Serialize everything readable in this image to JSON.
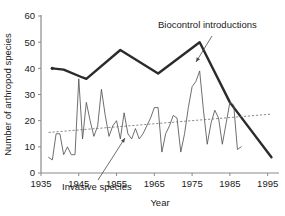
{
  "chart_data": {
    "type": "line",
    "title": "",
    "xlabel": "Year",
    "ylabel": "Number of arthropod species",
    "xlim": [
      1935,
      1998
    ],
    "ylim": [
      0,
      60
    ],
    "xticks": [
      1935,
      1945,
      1955,
      1965,
      1975,
      1985,
      1995
    ],
    "yticks": [
      0,
      10,
      20,
      30,
      40,
      50,
      60
    ],
    "grid": false,
    "legend_position": "inline-annotations",
    "annotations": [
      {
        "name": "biocontrol-annotation",
        "text": "Biocontrol introductions",
        "text_x": 158,
        "text_y": 28,
        "arrow_from_x": 212,
        "arrow_from_y": 36,
        "arrow_to_x": 196,
        "arrow_to_y": 62
      },
      {
        "name": "invasive-annotation",
        "text": "Invasive species",
        "text_x": 62,
        "text_y": 190,
        "arrow_from_x": 98,
        "arrow_from_y": 180,
        "arrow_to_x": 125,
        "arrow_to_y": 138
      }
    ],
    "series": [
      {
        "name": "Biocontrol introductions",
        "style": "thick-solid",
        "color": "#2b2b2b",
        "marker_first": true,
        "x": [
          1938,
          1941,
          1946,
          1947,
          1956,
          1966,
          1977,
          1985,
          1996
        ],
        "values": [
          40,
          39.5,
          36.5,
          36,
          47,
          38,
          50,
          27,
          6
        ]
      },
      {
        "name": "Invasive species",
        "style": "thin-solid",
        "color": "#555555",
        "x": [
          1937,
          1938,
          1939,
          1940,
          1941,
          1942,
          1943,
          1944,
          1945,
          1946,
          1947,
          1948,
          1949,
          1950,
          1951,
          1952,
          1953,
          1954,
          1955,
          1956,
          1957,
          1958,
          1959,
          1960,
          1961,
          1962,
          1963,
          1964,
          1965,
          1966,
          1967,
          1968,
          1969,
          1970,
          1971,
          1972,
          1973,
          1974,
          1975,
          1976,
          1977,
          1978,
          1979,
          1980,
          1981,
          1982,
          1983,
          1984,
          1985,
          1986,
          1987,
          1988
        ],
        "values": [
          6,
          5,
          15,
          15,
          7,
          10,
          7,
          7,
          36,
          13,
          27,
          20,
          14,
          18,
          32,
          22,
          14,
          18,
          20,
          13,
          23,
          15,
          13,
          17,
          13,
          15,
          18,
          21,
          25,
          25,
          8,
          15,
          18,
          22,
          21,
          8,
          15,
          25,
          33,
          35,
          39,
          24,
          11,
          19,
          24,
          21,
          11,
          19,
          27,
          26,
          9,
          10
        ]
      },
      {
        "name": "Invasive species trend",
        "style": "dashed",
        "color": "#6b6b6b",
        "x": [
          1937,
          1996
        ],
        "values": [
          15.5,
          22.5
        ]
      }
    ]
  },
  "axes": {
    "y_label": "Number of arthropod species",
    "x_label": "Year"
  }
}
